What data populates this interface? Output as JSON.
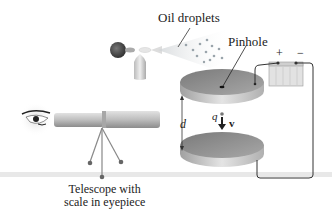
{
  "labels": {
    "oil_droplets": "Oil droplets",
    "pinhole": "Pinhole",
    "plus": "+",
    "minus": "−",
    "distance": "d",
    "charge": "q",
    "velocity": "v⃗",
    "telescope_line1": "Telescope with",
    "telescope_line2": "scale in eyepiece"
  },
  "colors": {
    "plate": "#8e8e8e",
    "plate_edge": "#c4c4c4",
    "wire": "#333333",
    "battery": "#dcdcdc",
    "telescope": "#c0c0c0",
    "floor": "#e6e6e6"
  }
}
